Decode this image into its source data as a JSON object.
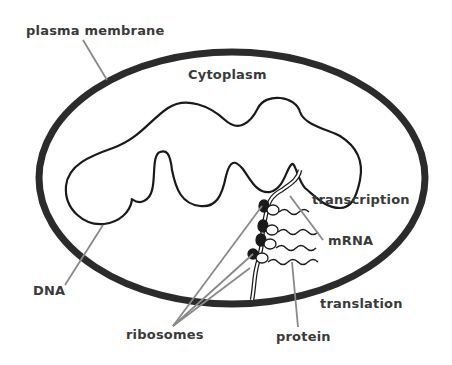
{
  "diagram": {
    "labels": {
      "plasma_membrane": "plasma membrane",
      "cytoplasm": "Cytoplasm",
      "transcription": "transcription",
      "mrna": "mRNA",
      "dna": "DNA",
      "translation": "translation",
      "ribosomes": "ribosomes",
      "protein": "protein"
    },
    "colors": {
      "membrane": "#2b2b2b",
      "dna": "#1a1a1a",
      "leader_line": "#8a8a8a",
      "label_text": "#3a3a3a",
      "ribosome": "#1a1a1a"
    }
  }
}
